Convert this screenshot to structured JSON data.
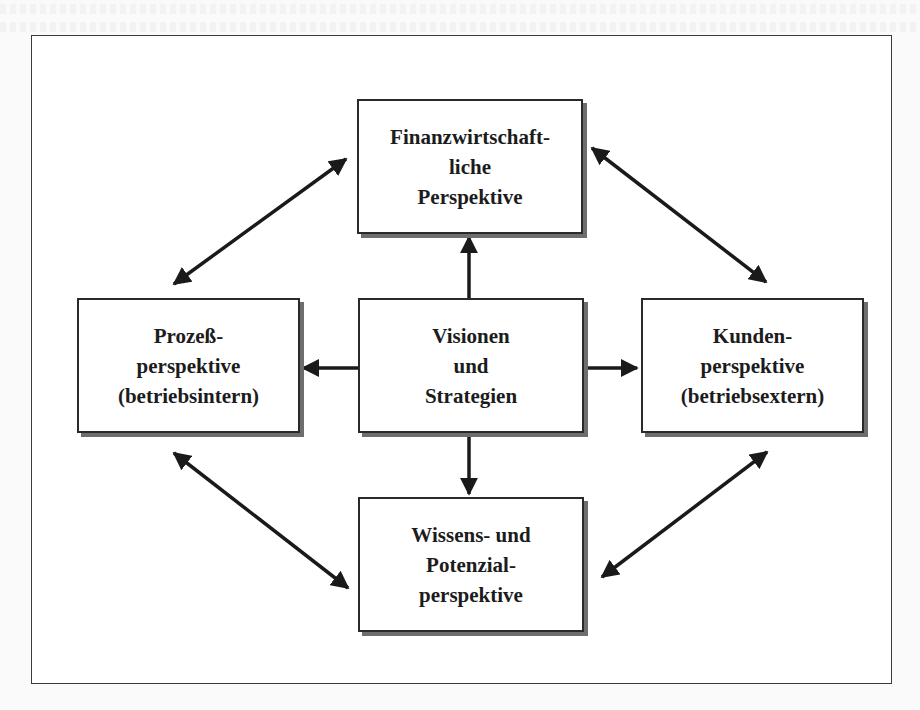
{
  "diagram": {
    "type": "balanced-scorecard",
    "colors": {
      "stroke": "#1a1a1a",
      "box_fill": "#ffffff",
      "shadow": "#6e6e6e",
      "frame": "#3a3a3a"
    },
    "boxes": {
      "top": {
        "lines": [
          "Finanzwirtschaft-",
          "liche",
          "Perspektive"
        ]
      },
      "left": {
        "lines": [
          "Prozeß-",
          "perspektive",
          "(betriebsintern)"
        ]
      },
      "center": {
        "lines": [
          "Visionen",
          "und",
          "Strategien"
        ]
      },
      "right": {
        "lines": [
          "Kunden-",
          "perspektive",
          "(betriebsextern)"
        ]
      },
      "bottom": {
        "lines": [
          "Wissens- und",
          "Potenzial-",
          "perspektive"
        ]
      }
    },
    "connections": [
      {
        "from": "center",
        "to": "top",
        "style": "single-arrow"
      },
      {
        "from": "center",
        "to": "left",
        "style": "single-arrow"
      },
      {
        "from": "center",
        "to": "right",
        "style": "single-arrow"
      },
      {
        "from": "center",
        "to": "bottom",
        "style": "single-arrow"
      },
      {
        "from": "left",
        "to": "top",
        "style": "double-arrow"
      },
      {
        "from": "top",
        "to": "right",
        "style": "double-arrow"
      },
      {
        "from": "left",
        "to": "bottom",
        "style": "double-arrow"
      },
      {
        "from": "bottom",
        "to": "right",
        "style": "double-arrow"
      }
    ]
  }
}
